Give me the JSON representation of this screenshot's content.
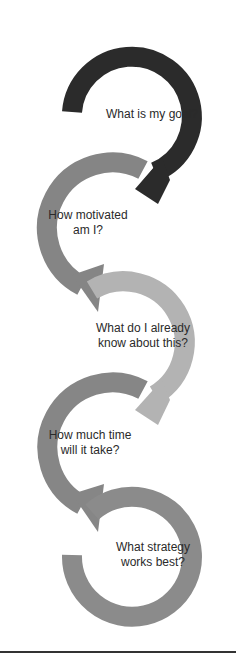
{
  "diagram": {
    "type": "cycle-arrows",
    "steps": [
      {
        "line1": "What is my goal?",
        "line2": "",
        "color": "#2b2b2b"
      },
      {
        "line1": "How motivated",
        "line2": "am I?",
        "color": "#858585"
      },
      {
        "line1": "What do I already",
        "line2": "know about this?",
        "color": "#b3b3b3"
      },
      {
        "line1": "How much time",
        "line2": "will it take?",
        "color": "#868686"
      },
      {
        "line1": "What strategy",
        "line2": "works best?",
        "color": "#8b8b8b"
      }
    ]
  }
}
